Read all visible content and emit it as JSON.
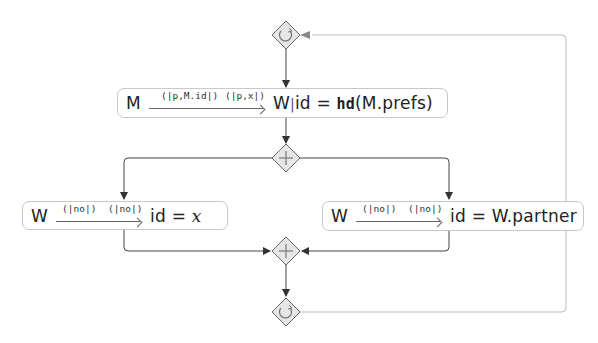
{
  "diagram": {
    "type": "process-flow",
    "colors": {
      "line": "#555555",
      "box_border": "#c8c8c8",
      "gateway_fill": "#e6e6e6",
      "gateway_border": "#666666",
      "loop_line": "#bbbbbb"
    },
    "gateways": [
      {
        "id": "loop-start",
        "kind": "loop",
        "icon": "loop-arrow-icon"
      },
      {
        "id": "parallel-split",
        "kind": "parallel",
        "icon": "plus-icon"
      },
      {
        "id": "parallel-join",
        "kind": "parallel",
        "icon": "plus-icon"
      },
      {
        "id": "loop-end",
        "kind": "loop",
        "icon": "loop-arrow-icon"
      }
    ],
    "tasks": [
      {
        "id": "task-main",
        "source": "M",
        "label_1": "(|p,M.id|)",
        "label_2": "(|p,x|)",
        "target_prefix": "W",
        "target_sep": "|",
        "expr_lhs": "id",
        "expr_eq": "=",
        "expr_fn": "hd",
        "expr_arg": "(M.prefs)"
      },
      {
        "id": "task-left",
        "source": "W",
        "label_1": "(|no|)",
        "label_2": "(|no|)",
        "expr_lhs": "id",
        "expr_eq": "=",
        "expr_rhs": "x"
      },
      {
        "id": "task-right",
        "source": "W",
        "label_1": "(|no|)",
        "label_2": "(|no|)",
        "expr_lhs": "id",
        "expr_eq": "=",
        "expr_rhs": "W.partner"
      }
    ],
    "edges": [
      {
        "from": "loop-start",
        "to": "task-main"
      },
      {
        "from": "task-main",
        "to": "parallel-split"
      },
      {
        "from": "parallel-split",
        "to": "task-left"
      },
      {
        "from": "parallel-split",
        "to": "task-right"
      },
      {
        "from": "task-left",
        "to": "parallel-join"
      },
      {
        "from": "task-right",
        "to": "parallel-join"
      },
      {
        "from": "parallel-join",
        "to": "loop-end"
      },
      {
        "from": "loop-end",
        "to": "loop-start",
        "style": "loop-back"
      }
    ]
  }
}
